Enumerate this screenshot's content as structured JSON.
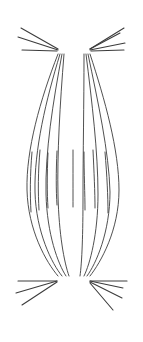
{
  "figure": {
    "caption": "",
    "background_color": "#ffffff",
    "stroke_color": "#3c3c3c",
    "width": 143,
    "height": 342
  },
  "chart_data": {
    "type": "diagram",
    "subtitle": "",
    "xlabel": "",
    "ylabel": "",
    "grid": false,
    "legend": "none",
    "xlim": [
      0,
      143
    ],
    "ylim": [
      0,
      342
    ],
    "style": {
      "stroke": "#3c3c3c",
      "stroke_width_fiber": 0.9,
      "stroke_width_short_fiber": 0.9,
      "stroke_width_ray": 1.1,
      "fill": "none",
      "background": "#ffffff"
    },
    "poles": [
      {
        "name": "top-left-pole",
        "x": 61,
        "y": 52
      },
      {
        "name": "top-right-pole",
        "x": 87,
        "y": 52
      },
      {
        "name": "bottom-left-pole",
        "x": 61,
        "y": 277
      },
      {
        "name": "bottom-right-pole",
        "x": 87,
        "y": 277
      }
    ],
    "spindle_fibers": [
      {
        "name": "fiber-1",
        "path": "M 58 54 C 40 100, 26 150, 27 190 C 28 230, 46 262, 58 276"
      },
      {
        "name": "fiber-2",
        "path": "M 60 54 C 46 100, 34 150, 35 192 C 36 232, 52 264, 62 276"
      },
      {
        "name": "fiber-3",
        "path": "M 62 54 C 53 102, 45 152, 46 194 C 47 234, 58 264, 66 276"
      },
      {
        "name": "fiber-4",
        "path": "M 64 54 C 60 104, 57 154, 58 196 C 59 234, 64 262, 69 276"
      },
      {
        "name": "fiber-5",
        "path": "M 84 54 C 84 104, 83 154, 83 196 C 83 234, 82 262, 80 276"
      },
      {
        "name": "fiber-6",
        "path": "M 86 54 C 92 102, 98 152, 98 194 C 98 234, 90 264, 84 276"
      },
      {
        "name": "fiber-7",
        "path": "M 88 54 C 98 102, 109 152, 110 192 C 110 232, 96 264, 87 276"
      },
      {
        "name": "fiber-8",
        "path": "M 90 54 C 105 100, 119 150, 119 190 C 119 230, 101 262, 90 276"
      }
    ],
    "interpolar_fibers": [
      {
        "name": "short-fiber-l1",
        "path": "M 32 152 C 30 175, 30 195, 31 212"
      },
      {
        "name": "short-fiber-l2",
        "path": "M 40 150 C 38 172, 38 192, 39 210"
      },
      {
        "name": "short-fiber-l3",
        "path": "M 48 153 C 47 175, 47 193, 48 208"
      },
      {
        "name": "short-fiber-l4",
        "path": "M 57 151 C 56 172, 56 190, 57 205"
      },
      {
        "name": "short-fiber-r1",
        "path": "M 73 150 C 73 172, 73 192, 73 207"
      },
      {
        "name": "short-fiber-r2",
        "path": "M 84 152 C 84 174, 85 194, 85 210"
      },
      {
        "name": "short-fiber-r3",
        "path": "M 93 150 C 94 172, 95 192, 95 208"
      },
      {
        "name": "short-fiber-r4",
        "path": "M 105 152 C 107 176, 108 196, 108 213"
      }
    ],
    "astral_rays": [
      {
        "name": "astral-ray-tl-1",
        "x1": 58,
        "y1": 49,
        "x2": 21,
        "y2": 28
      },
      {
        "name": "astral-ray-tl-2",
        "x1": 58,
        "y1": 50,
        "x2": 18,
        "y2": 37
      },
      {
        "name": "astral-ray-tl-3",
        "x1": 57,
        "y1": 51,
        "x2": 22,
        "y2": 50
      },
      {
        "name": "astral-ray-tr-1",
        "x1": 90,
        "y1": 49,
        "x2": 124,
        "y2": 28
      },
      {
        "name": "astral-ray-tr-2",
        "x1": 90,
        "y1": 49,
        "x2": 120,
        "y2": 33
      },
      {
        "name": "astral-ray-tr-3",
        "x1": 90,
        "y1": 50,
        "x2": 125,
        "y2": 43
      },
      {
        "name": "astral-ray-tr-4",
        "x1": 91,
        "y1": 51,
        "x2": 124,
        "y2": 50
      },
      {
        "name": "astral-ray-bl-1",
        "x1": 57,
        "y1": 281,
        "x2": 18,
        "y2": 281
      },
      {
        "name": "astral-ray-bl-2",
        "x1": 57,
        "y1": 281,
        "x2": 16,
        "y2": 293
      },
      {
        "name": "astral-ray-bl-3",
        "x1": 57,
        "y1": 282,
        "x2": 22,
        "y2": 305
      },
      {
        "name": "astral-ray-br-1",
        "x1": 90,
        "y1": 281,
        "x2": 127,
        "y2": 281
      },
      {
        "name": "astral-ray-br-2",
        "x1": 90,
        "y1": 281,
        "x2": 123,
        "y2": 288
      },
      {
        "name": "astral-ray-br-3",
        "x1": 90,
        "y1": 282,
        "x2": 122,
        "y2": 298
      },
      {
        "name": "astral-ray-br-4",
        "x1": 90,
        "y1": 283,
        "x2": 113,
        "y2": 310
      }
    ]
  }
}
